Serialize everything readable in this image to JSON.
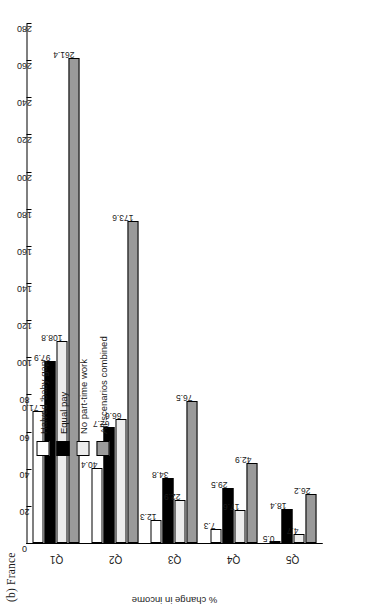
{
  "figure": {
    "panel_label": "(b) France"
  },
  "chart_data": {
    "type": "bar",
    "title": "(b) France",
    "xlabel": "",
    "ylabel": "% change in income",
    "categories": [
      "Q1",
      "Q2",
      "Q3",
      "Q4",
      "Q5"
    ],
    "ylim": [
      0,
      280
    ],
    "yticks": [
      0,
      20,
      40,
      60,
      80,
      100,
      120,
      140,
      160,
      180,
      200,
      220,
      240,
      260,
      280
    ],
    "grid": false,
    "legend_position": "upper-right",
    "orientation": "vertical-bars-page-rotated-90",
    "series": [
      {
        "name": "Halved 'baby gap'",
        "color": "#ffffff",
        "values": [
          71.0,
          40.4,
          12.3,
          7.3,
          0.5
        ],
        "labels": [
          "71.0",
          "40.4",
          "12.3",
          "7.3",
          "0.5"
        ]
      },
      {
        "name": "Equal pay",
        "color": "#000000",
        "values": [
          97.9,
          62.7,
          34.8,
          29.5,
          18.4
        ],
        "labels": [
          "97.9",
          "62.7",
          "34.8",
          "29.5",
          "18.4"
        ]
      },
      {
        "name": "No part-time work",
        "color": "#ececec",
        "values": [
          108.8,
          66.6,
          22.9,
          17.6,
          4.7
        ],
        "labels": [
          "108.8",
          "66.6",
          "22.9",
          "17.6",
          "4.7"
        ]
      },
      {
        "name": "All scenarios combined",
        "color": "#9a9a9a",
        "values": [
          261.4,
          173.6,
          76.5,
          42.9,
          26.2
        ],
        "labels": [
          "261.4",
          "173.6",
          "76.5",
          "42.9",
          "26.2"
        ]
      }
    ]
  },
  "ytick_labels": [
    "0",
    "20",
    "40",
    "60",
    "80",
    "100",
    "120",
    "140",
    "160",
    "180",
    "200",
    "220",
    "240",
    "260",
    "280"
  ],
  "legend": {
    "items": [
      {
        "label": "Halved 'baby gap'",
        "color": "#ffffff"
      },
      {
        "label": "Equal pay",
        "color": "#000000"
      },
      {
        "label": "No part-time work",
        "color": "#ececec"
      },
      {
        "label": "All scenarios combined",
        "color": "#9a9a9a"
      }
    ]
  }
}
